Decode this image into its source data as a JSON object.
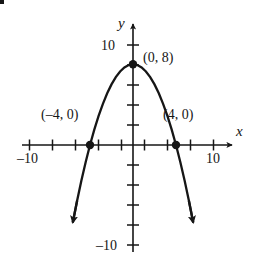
{
  "figure": {
    "kind": "coordinate-plane-parabola",
    "bullet": "▪"
  },
  "axes": {
    "x_axis_label": "x",
    "y_axis_label": "y",
    "x_tick_labels": [
      {
        "text": "–10",
        "value": -10
      },
      {
        "text": "10",
        "value": 10
      }
    ],
    "y_tick_labels": [
      {
        "text": "10",
        "value": 10
      },
      {
        "text": "–10",
        "value": -10
      }
    ]
  },
  "annotations": [
    {
      "text": "(0, 8)",
      "point": [
        0,
        8
      ]
    },
    {
      "text": "(–4, 0)",
      "point": [
        -4,
        0
      ]
    },
    {
      "text": "(4, 0)",
      "point": [
        4,
        0
      ]
    }
  ],
  "chart_data": {
    "type": "line",
    "title": "",
    "xlabel": "x",
    "ylabel": "y",
    "xlim": [
      -11,
      11
    ],
    "ylim": [
      -12,
      11
    ],
    "grid": false,
    "legend": false,
    "curve": {
      "name": "parabola",
      "equation": "y = -0.5x^2 + 8",
      "vertex": [
        0,
        8
      ],
      "opens": "down",
      "x_intercepts": [
        -4,
        4
      ],
      "y_intercept": 8,
      "x": [
        -5.6,
        -5.2,
        -4.8,
        -4.4,
        -4.0,
        -3.6,
        -3.2,
        -2.8,
        -2.4,
        -2.0,
        -1.6,
        -1.2,
        -0.8,
        -0.4,
        0,
        0.4,
        0.8,
        1.2,
        1.6,
        2.0,
        2.4,
        2.8,
        3.2,
        3.6,
        4.0,
        4.4,
        4.8,
        5.2,
        5.6
      ],
      "y": [
        -7.68,
        -5.52,
        -3.52,
        -1.68,
        0,
        1.52,
        2.88,
        4.08,
        5.12,
        6.0,
        6.72,
        7.28,
        7.68,
        7.92,
        8.0,
        7.92,
        7.68,
        7.28,
        6.72,
        6.0,
        5.12,
        4.08,
        2.88,
        1.52,
        0,
        -1.68,
        -3.52,
        -5.52,
        -7.68
      ]
    },
    "marked_points": [
      {
        "label": "(0, 8)",
        "x": 0,
        "y": 8
      },
      {
        "label": "(–4, 0)",
        "x": -4,
        "y": 0
      },
      {
        "label": "(4, 0)",
        "x": 4,
        "y": 0
      }
    ],
    "axis_arrows": [
      "x-positive",
      "y-positive",
      "curve-both-ends"
    ]
  },
  "colors": {
    "ink": "#161616",
    "background": "#ffffff"
  }
}
